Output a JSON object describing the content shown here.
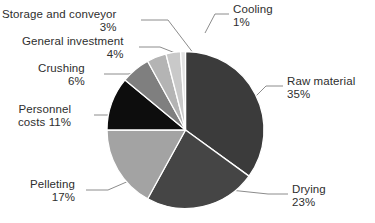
{
  "chart_data": {
    "type": "pie",
    "title": "",
    "subtitle": "",
    "xlabel": "",
    "ylabel": "",
    "legend_position": "callout-labels",
    "grid": false,
    "total_percent": 100,
    "start_angle_deg": 0,
    "direction": "clockwise",
    "categories": [
      "Raw material",
      "Drying",
      "Pelleting",
      "Personnel costs",
      "Crushing",
      "General investment",
      "Storage and conveyor",
      "Cooling"
    ],
    "values": [
      35,
      23,
      17,
      11,
      6,
      4,
      3,
      1
    ],
    "value_labels": [
      "35%",
      "23%",
      "17%",
      "11%",
      "6%",
      "4%",
      "3%",
      "1%"
    ],
    "colors": [
      "#3b3b3b",
      "#454545",
      "#a3a3a3",
      "#0d0d0d",
      "#7f7f7f",
      "#b4b4b4",
      "#c9c9c9",
      "#e2e2e2"
    ],
    "slice_separator_color": "#ffffff",
    "background_color": "#ffffff",
    "text_color": "#2e2e2e",
    "leader_line_color": "#8c8c8c"
  },
  "labels": {
    "raw_material": {
      "name": "Raw material",
      "pct": "35%"
    },
    "drying": {
      "name": "Drying",
      "pct": "23%"
    },
    "pelleting": {
      "name": "Pelleting",
      "pct": "17%"
    },
    "personnel_costs": {
      "name": "Personnel",
      "name2": "costs",
      "pct": "11%"
    },
    "crushing": {
      "name": "Crushing",
      "pct": "6%"
    },
    "general_investment": {
      "name": "General investment",
      "pct": "4%"
    },
    "storage_and_conveyor": {
      "name": "Storage and conveyor",
      "pct": "3%"
    },
    "cooling": {
      "name": "Cooling",
      "pct": "1%"
    }
  }
}
